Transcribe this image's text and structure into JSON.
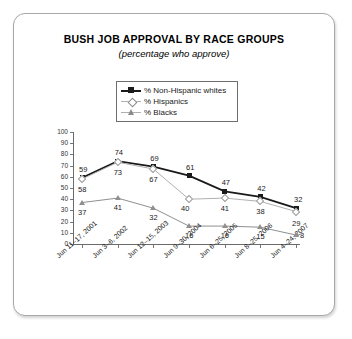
{
  "chart_data": {
    "type": "line",
    "title": "BUSH JOB APPROVAL BY RACE GROUPS",
    "subtitle": "(percentage who approve)",
    "xlabel": "",
    "ylabel": "",
    "ylim": [
      0,
      100
    ],
    "yticks": [
      0,
      10,
      20,
      30,
      40,
      50,
      60,
      70,
      80,
      90,
      100
    ],
    "grid": false,
    "legend_position": "top-center",
    "categories": [
      "Jun 11–17, 2001",
      "Jun 3–6, 2002",
      "Jun 12–15, 2003",
      "Jun 9–30, 2004",
      "Jun 6–25, 2005",
      "Jun 8–25, 2006",
      "Jun 4–24, 2007"
    ],
    "series": [
      {
        "name": "% Non-Hispanic whites",
        "marker": "filled-square",
        "color": "#1a1a1a",
        "values": [
          59,
          74,
          69,
          61,
          47,
          42,
          32
        ]
      },
      {
        "name": "% Hispanics",
        "marker": "open-diamond",
        "color": "#b0b0b0",
        "values": [
          58,
          73,
          67,
          40,
          41,
          38,
          29
        ]
      },
      {
        "name": "% Blacks",
        "marker": "filled-triangle",
        "color": "#8f8f8f",
        "values": [
          37,
          41,
          32,
          16,
          16,
          15,
          8
        ]
      }
    ]
  }
}
